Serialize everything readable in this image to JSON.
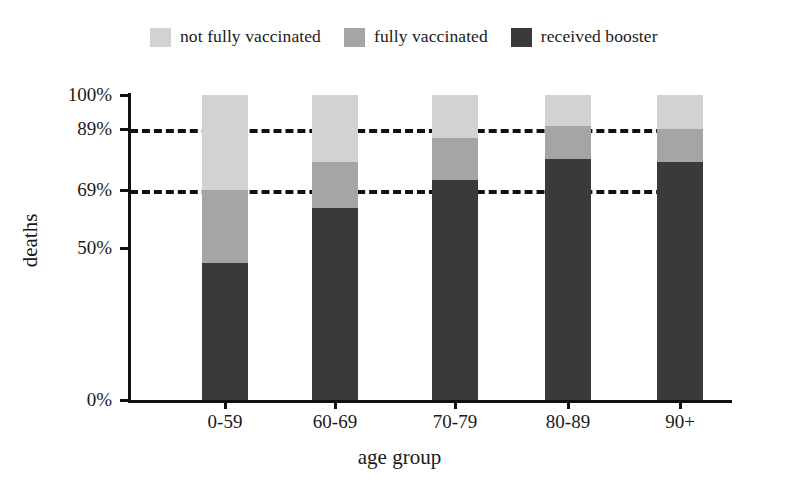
{
  "chart_data": {
    "type": "bar",
    "stacked": true,
    "title": "",
    "xlabel": "age group",
    "ylabel": "deaths",
    "categories": [
      "0-59",
      "60-69",
      "70-79",
      "80-89",
      "90+"
    ],
    "series": [
      {
        "name": "received booster",
        "color": "#3a3a3a",
        "values": [
          45,
          63,
          72,
          79,
          78
        ]
      },
      {
        "name": "fully vaccinated",
        "color": "#a5a5a5",
        "values": [
          24,
          15,
          14,
          11,
          11
        ]
      },
      {
        "name": "not fully vaccinated",
        "color": "#d2d2d2",
        "values": [
          31,
          22,
          14,
          10,
          11
        ]
      }
    ],
    "ylim": [
      0,
      100
    ],
    "ytick_values": [
      0,
      50,
      69,
      89,
      100
    ],
    "ytick_labels": [
      "0%",
      "50%",
      "69%",
      "89%",
      "100%"
    ],
    "reference_lines": [
      {
        "value": 89,
        "label": "89%",
        "style": "dashed"
      },
      {
        "value": 69,
        "label": "69%",
        "style": "dashed"
      }
    ],
    "grid": false,
    "legend_position": "top"
  },
  "legend": {
    "items": [
      {
        "label": "not fully vaccinated",
        "color": "#d2d2d2"
      },
      {
        "label": "fully vaccinated",
        "color": "#a5a5a5"
      },
      {
        "label": "received booster",
        "color": "#3a3a3a"
      }
    ]
  },
  "axes": {
    "x_title": "age group",
    "y_title": "deaths"
  }
}
